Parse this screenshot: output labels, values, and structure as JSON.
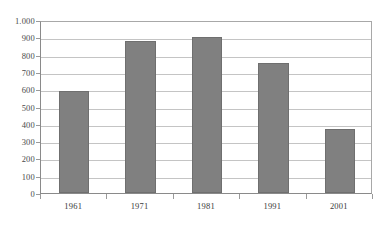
{
  "chart_data": {
    "type": "bar",
    "title": "",
    "subtitle": "",
    "xlabel": "",
    "ylabel": "",
    "categories": [
      "1961",
      "1971",
      "1981",
      "1991",
      "2001"
    ],
    "values": [
      590,
      880,
      900,
      750,
      368
    ],
    "series": [
      {
        "name": "",
        "values": [
          590,
          880,
          900,
          750,
          368
        ],
        "color": "#808080"
      }
    ],
    "ylim": [
      0,
      1000
    ],
    "ytick_values": [
      0,
      100,
      200,
      300,
      400,
      500,
      600,
      700,
      800,
      900,
      1000
    ],
    "ytick_labels": [
      "0",
      "100",
      "200",
      "300",
      "400",
      "500",
      "600",
      "700",
      "800",
      "900",
      "1.000"
    ],
    "grid": true,
    "grid_axis": "y",
    "legend": false,
    "legend_position": "none",
    "bar_color": "#808080",
    "plot_background": "#ffffff",
    "gridline_color": "#c4c4c4",
    "axis_color": "#8a8a8a"
  },
  "caption": {
    "text": "",
    "note": "clipped-at-image-bottom"
  }
}
